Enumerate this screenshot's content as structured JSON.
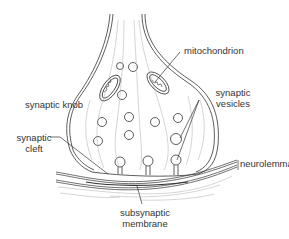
{
  "diagram": {
    "title": "Synaptic knob",
    "labels": {
      "mitochondrion": "mitochondrion",
      "synaptic_knob": "synaptic knob",
      "synaptic_vesicles_1": "synaptic",
      "synaptic_vesicles_2": "vesicles",
      "synaptic_cleft_1": "synaptic",
      "synaptic_cleft_2": "cleft",
      "neurolemma": "neurolemma",
      "subsynaptic_membrane_1": "subsynaptic",
      "subsynaptic_membrane_2": "membrane"
    },
    "colors": {
      "line": "#333333",
      "faint": "#9a9a9a",
      "background": "#ffffff"
    }
  }
}
